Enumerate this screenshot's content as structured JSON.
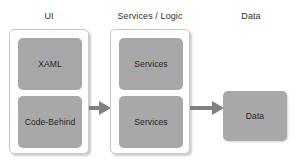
{
  "diagram": {
    "title_columns": [
      {
        "key": "ui",
        "label": "UI"
      },
      {
        "key": "services",
        "label": "Services / Logic"
      },
      {
        "key": "data",
        "label": "Data"
      }
    ],
    "colors": {
      "block_fill": "#a8a8a8",
      "container_fill": "#ffffff",
      "container_border": "#c9c9c9",
      "arrow_fill": "#808080",
      "text": "#262626",
      "background": "#ffffff"
    },
    "columns": {
      "ui": {
        "header": "UI",
        "blocks": [
          {
            "label": "XAML"
          },
          {
            "label": "Code-Behind"
          }
        ]
      },
      "services": {
        "header": "Services / Logic",
        "blocks": [
          {
            "label": "Services"
          },
          {
            "label": "Services"
          }
        ]
      },
      "data": {
        "header": "Data",
        "blocks": [
          {
            "label": "Data"
          }
        ]
      }
    },
    "arrows": [
      {
        "from": "ui",
        "to": "services",
        "direction": "right"
      },
      {
        "from": "services",
        "to": "data",
        "direction": "right"
      }
    ]
  }
}
